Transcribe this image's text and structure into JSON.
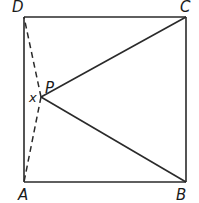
{
  "diagram": {
    "type": "geometry",
    "shape": "square",
    "vertices": {
      "A": {
        "label": "A",
        "position": "bottom-left"
      },
      "B": {
        "label": "B",
        "position": "bottom-right"
      },
      "C": {
        "label": "C",
        "position": "top-right"
      },
      "D": {
        "label": "D",
        "position": "top-left"
      }
    },
    "interior_point": {
      "label": "P"
    },
    "angle_label": "x",
    "segments": {
      "solid": [
        "AB",
        "BC",
        "CD",
        "DA",
        "PC",
        "PB"
      ],
      "dashed": [
        "PD",
        "PA"
      ]
    },
    "colors": {
      "line": "#2a2a2a",
      "text": "#1a1a1a",
      "background": "#ffffff"
    }
  }
}
